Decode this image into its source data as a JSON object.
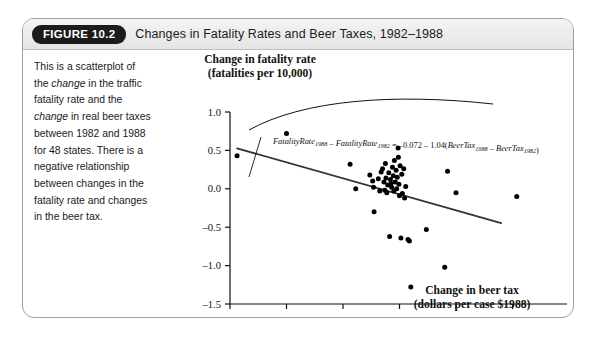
{
  "figure": {
    "badge": "FIGURE 10.2",
    "title": "Changes in Fatality Rates and Beer Taxes, 1982–1988"
  },
  "caption": {
    "text": "This is a scatterplot of the change in the traffic fatality rate and the change in real beer taxes between 1982 and 1988 for 48 states. There is a negative relationship between changes in the fatality rate and changes in the beer tax."
  },
  "colors": {
    "ink": "#111111",
    "frame": "#9aa0a6",
    "badge_bg": "#1b1b1b",
    "point": "#000000",
    "line": "#333333"
  },
  "annotation": {
    "equation_plain": "FatalityRate1988 − FatalityRate1982 = −0.072 − 1.04(BeerTax1988 − BeerTax1982)",
    "part1": "FatalityRate",
    "sub1": "1988",
    "op1": "–",
    "part2": "FatalityRate",
    "sub2": "1982",
    "eq": "=",
    "intercept": "–0.072",
    "op2": "–",
    "slope": "1.04(",
    "part3": "BeerTax",
    "sub3": "1988",
    "op3": "–",
    "part4": "BeerTax",
    "sub4": "1982",
    "close": ")"
  },
  "chart_data": {
    "type": "scatter",
    "title": "Changes in Fatality Rates and Beer Taxes, 1982–1988",
    "xlabel_line1": "Change in beer tax",
    "xlabel_line2": "(dollars per case $1988)",
    "ylabel_line1": "Change in fatality rate",
    "ylabel_line2": "(fatalities per 10,000)",
    "xlim": [
      -0.6,
      0.6
    ],
    "ylim": [
      -1.5,
      1.0
    ],
    "xticks": [
      -0.6,
      -0.4,
      -0.2,
      0.0,
      0.2,
      0.4,
      0.6
    ],
    "xticklabels": [
      "–0.6",
      "–0.4",
      "–0.2",
      "0.0",
      "0.2",
      "0.4",
      "0.6"
    ],
    "yticks": [
      -1.5,
      -1.0,
      -0.5,
      0.0,
      0.5,
      1.0
    ],
    "yticklabels": [
      "–1.5",
      "–1.0",
      "–0.5",
      "0.0",
      "0.5",
      "1.0"
    ],
    "grid": false,
    "legend": null,
    "n_points": 48,
    "fit_line": {
      "intercept": -0.072,
      "slope": -1.04,
      "x_start": -0.575,
      "x_end": 0.36
    },
    "points": [
      [
        -0.575,
        0.43
      ],
      [
        -0.4,
        0.72
      ],
      [
        -0.175,
        0.32
      ],
      [
        -0.155,
        0.0
      ],
      [
        -0.105,
        0.18
      ],
      [
        -0.095,
        0.1
      ],
      [
        -0.092,
        0.02
      ],
      [
        -0.09,
        -0.3
      ],
      [
        -0.075,
        0.13
      ],
      [
        -0.07,
        -0.03
      ],
      [
        -0.065,
        0.22
      ],
      [
        -0.06,
        0.26
      ],
      [
        -0.055,
        0.09
      ],
      [
        -0.052,
        -0.02
      ],
      [
        -0.05,
        0.33
      ],
      [
        -0.048,
        0.14
      ],
      [
        -0.045,
        -0.05
      ],
      [
        -0.042,
        0.05
      ],
      [
        -0.038,
        0.21
      ],
      [
        -0.035,
        -0.62
      ],
      [
        -0.032,
        0.12
      ],
      [
        -0.03,
        0.07
      ],
      [
        -0.028,
        0.02
      ],
      [
        -0.025,
        0.28
      ],
      [
        -0.022,
        0.17
      ],
      [
        -0.02,
        -0.03
      ],
      [
        -0.018,
        0.37
      ],
      [
        -0.015,
        0.09
      ],
      [
        -0.012,
        0.24
      ],
      [
        -0.01,
        0.0
      ],
      [
        -0.008,
        0.15
      ],
      [
        -0.005,
        0.53
      ],
      [
        -0.004,
        0.41
      ],
      [
        -0.002,
        0.06
      ],
      [
        0.0,
        -0.09
      ],
      [
        0.002,
        0.3
      ],
      [
        0.005,
        -0.64
      ],
      [
        0.008,
        0.19
      ],
      [
        0.01,
        -0.06
      ],
      [
        0.015,
        0.26
      ],
      [
        0.018,
        -0.12
      ],
      [
        0.022,
        0.03
      ],
      [
        0.03,
        -0.66
      ],
      [
        0.035,
        -0.68
      ],
      [
        0.04,
        -1.28
      ],
      [
        0.095,
        -0.53
      ],
      [
        0.16,
        -1.02
      ],
      [
        0.17,
        0.23
      ],
      [
        0.2,
        -0.05
      ],
      [
        0.415,
        -0.1
      ]
    ]
  }
}
